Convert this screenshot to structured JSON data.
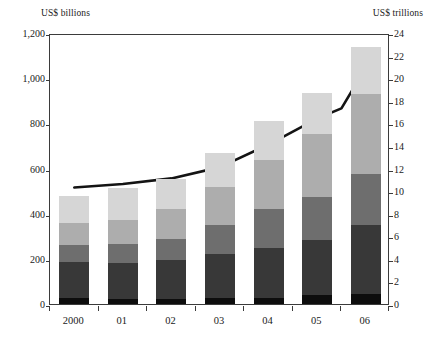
{
  "chart_data": {
    "type": "bar",
    "title": "",
    "subtitle": "",
    "xlabel": "",
    "ylabel": "US$ billions",
    "y2label": "US$ trillions",
    "categories": [
      "2000",
      "01",
      "02",
      "03",
      "04",
      "05",
      "06"
    ],
    "ylim": [
      0,
      1200
    ],
    "y2lim": [
      0,
      24
    ],
    "yticks": [
      "0",
      "200",
      "400",
      "600",
      "800",
      "1,000",
      "1,200"
    ],
    "ytick_values": [
      0,
      200,
      400,
      600,
      800,
      1000,
      1200
    ],
    "y2ticks": [
      "0",
      "2",
      "4",
      "6",
      "8",
      "10",
      "12",
      "14",
      "16",
      "18",
      "20",
      "22",
      "24"
    ],
    "y2tick_values": [
      0,
      2,
      4,
      6,
      8,
      10,
      12,
      14,
      16,
      18,
      20,
      22,
      24
    ],
    "grid": false,
    "legend_position": "none",
    "stacked": true,
    "series": [
      {
        "name": "segment-1",
        "color": "#0d0d0d",
        "values": [
          25,
          22,
          24,
          26,
          28,
          38,
          44
        ]
      },
      {
        "name": "segment-2",
        "color": "#383838",
        "values": [
          163,
          160,
          169,
          196,
          222,
          244,
          306
        ]
      },
      {
        "name": "segment-3",
        "color": "#6e6e6e",
        "values": [
          72,
          84,
          94,
          126,
          170,
          190,
          228
        ]
      },
      {
        "name": "segment-4",
        "color": "#adadad",
        "values": [
          100,
          108,
          136,
          170,
          220,
          280,
          352
        ]
      },
      {
        "name": "segment-5",
        "color": "#d6d6d6",
        "values": [
          118,
          140,
          131,
          152,
          172,
          182,
          208
        ]
      }
    ],
    "bar_totals": [
      478,
      514,
      554,
      670,
      812,
      934,
      1138
    ],
    "line_series": {
      "name": "line-overlay",
      "color": "#141414",
      "axis": "right",
      "unit": "US$ trillions",
      "values": [
        10.5,
        10.8,
        11.3,
        12.3,
        14.3,
        16.6,
        17.5,
        21.1
      ],
      "x_positions": [
        "2000",
        "01",
        "02",
        "03",
        "04",
        "05",
        "05.5",
        "06"
      ]
    },
    "colors": {
      "axis": "#3b3b3b",
      "text": "#1a1a1a",
      "background": "#ffffff"
    }
  }
}
